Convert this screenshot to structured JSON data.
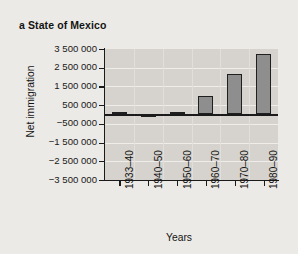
{
  "figure": {
    "panel_label": "a",
    "title": "a State of Mexico",
    "background_color": "#eceae6",
    "plot_background_color": "#d6d3ce",
    "bar_fill_color": "#8e8e8e",
    "bar_edge_color": "#1f1f1f"
  },
  "chart_data": {
    "type": "bar",
    "title": "a State of Mexico",
    "xlabel": "Years",
    "ylabel": "Net immigration",
    "categories": [
      "1933–40",
      "1940–50",
      "1950–60",
      "1960–70",
      "1970–80",
      "1980–90"
    ],
    "values": [
      60000,
      -110000,
      40000,
      1000000,
      2150000,
      3250000
    ],
    "ylim": [
      -3500000,
      3500000
    ],
    "ytick_values": [
      3500000,
      2500000,
      1500000,
      500000,
      -500000,
      -1500000,
      -2500000,
      -3500000
    ],
    "ytick_labels": [
      "3 500 000",
      "2 500 000",
      "1 500 000",
      "500 000",
      "−500 000",
      "−1 500 000",
      "−2 500 000",
      "−3 500 000"
    ],
    "grid": true,
    "grid_axis": "both",
    "legend": false,
    "zero_line": true,
    "xtick_label_rotation": 90
  }
}
